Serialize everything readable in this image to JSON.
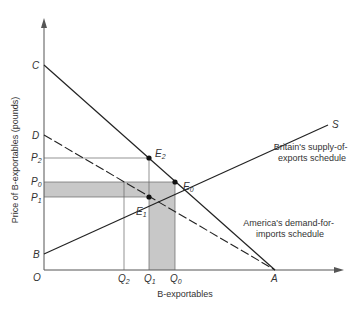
{
  "diagram": {
    "type": "supply-demand",
    "y_axis_label": "Price of B-exportables (pounds)",
    "x_axis_label": "B-exportables",
    "origin_label": "O",
    "vertical_labels": {
      "C": "C",
      "D": "D",
      "P2": {
        "base": "P",
        "sub": "2"
      },
      "P0": {
        "base": "P",
        "sub": "0"
      },
      "P1": {
        "base": "P",
        "sub": "1"
      },
      "B": "B"
    },
    "horizontal_labels": {
      "Q2": {
        "base": "Q",
        "sub": "2"
      },
      "Q1": {
        "base": "Q",
        "sub": "1"
      },
      "Q0": {
        "base": "Q",
        "sub": "0"
      },
      "A": "A"
    },
    "points": {
      "E0": {
        "base": "E",
        "sub": "0"
      },
      "E1": {
        "base": "E",
        "sub": "1"
      },
      "E2": {
        "base": "E",
        "sub": "2"
      }
    },
    "curve_end_label": "S",
    "supply_annotation": [
      "Britain's supply-of-",
      "exports schedule"
    ],
    "demand_annotation": [
      "America's demand-for-",
      "imports schedule"
    ],
    "shading_color": "#c8c8c8",
    "line_color": "#222222"
  }
}
